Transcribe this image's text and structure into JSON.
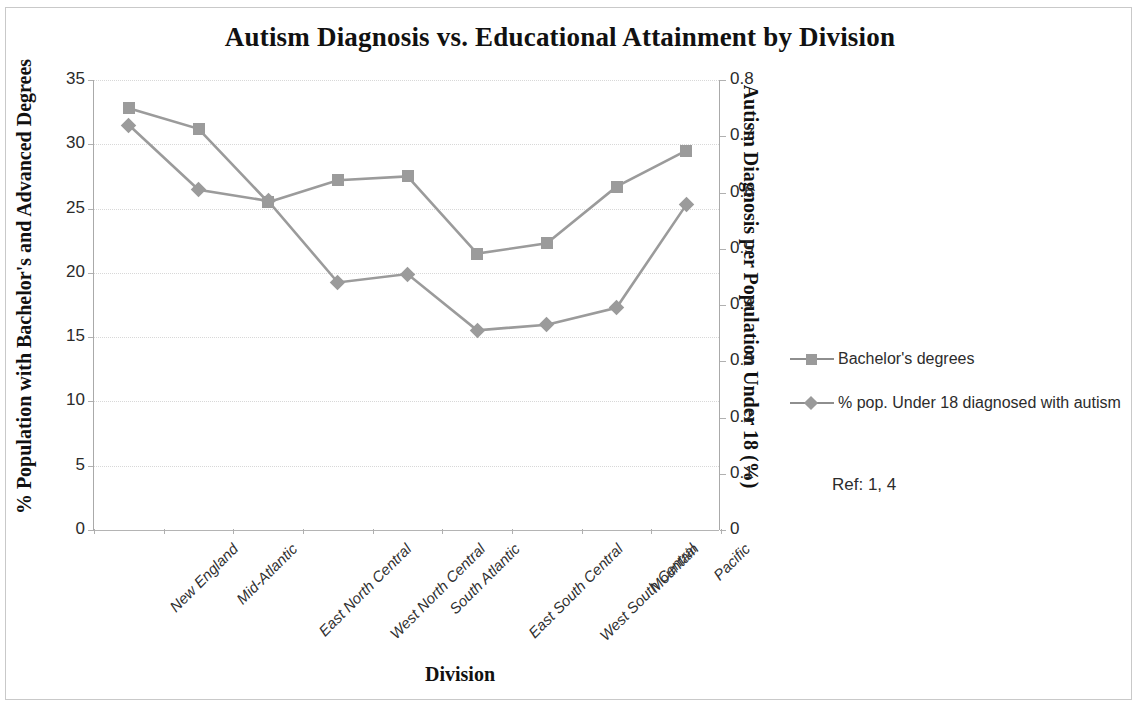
{
  "chart_data": {
    "type": "line",
    "title": "Autism Diagnosis vs. Educational Attainment by Division",
    "xlabel": "Division",
    "categories": [
      "New England",
      "Mid-Atlantic",
      "East North Central",
      "West North Central",
      "South Atlantic",
      "East South Central",
      "West South Central",
      "Mountain",
      "Pacific"
    ],
    "grid": true,
    "legend_position": "right",
    "axes": {
      "left": {
        "label": "% Population with Bachelor's and Advanced Degrees",
        "ylim": [
          0,
          35
        ],
        "ticks": [
          "0",
          "5",
          "10",
          "15",
          "20",
          "25",
          "30",
          "35"
        ],
        "tick_values": [
          0,
          5,
          10,
          15,
          20,
          25,
          30,
          35
        ]
      },
      "right": {
        "label": "Autism Diagnosis per Population Under 18 (%)",
        "ylim": [
          0,
          0.8
        ],
        "ticks": [
          "0",
          "0.1",
          "0.2",
          "0.3",
          "0.4",
          "0.5",
          "0.6",
          "0.7",
          "0.8"
        ],
        "tick_values": [
          0,
          0.1,
          0.2,
          0.3,
          0.4,
          0.5,
          0.6,
          0.7,
          0.8
        ]
      }
    },
    "series": [
      {
        "name": "Bachelor's degrees",
        "axis": "left",
        "marker": "square",
        "color": "#9b9b9b",
        "values": [
          32.8,
          31.2,
          25.5,
          27.2,
          27.5,
          21.5,
          22.3,
          26.7,
          29.5
        ]
      },
      {
        "name": "% pop. Under 18 diagnosed  with autism",
        "axis": "right",
        "marker": "diamond",
        "color": "#9b9b9b",
        "values": [
          0.72,
          0.605,
          0.585,
          0.44,
          0.455,
          0.355,
          0.365,
          0.395,
          0.578
        ]
      }
    ],
    "annotation": "Ref: 1, 4"
  }
}
